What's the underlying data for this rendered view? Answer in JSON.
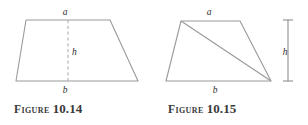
{
  "page": {
    "background_color": "#ffffff",
    "stroke_color": "#9a9a9a",
    "dashed_color": "#b0a9a9",
    "text_color": "#3a3a3a",
    "width": 308,
    "height": 125
  },
  "figures": [
    {
      "id": "figure-10-14",
      "caption_word": "Figure",
      "caption_number": "10.14",
      "shape": "trapezoid",
      "description": "trapezoid with dashed vertical height segment",
      "labels": {
        "top_side": "a",
        "height": "h",
        "bottom_side": "b"
      },
      "geometry": {
        "top_left": [
          26,
          20
        ],
        "top_right": [
          110,
          20
        ],
        "bottom_right": [
          138,
          81
        ],
        "bottom_left": [
          16,
          81
        ],
        "height_line_x": 68,
        "height_line_top_y": 20,
        "height_line_bottom_y": 81
      },
      "label_positions": {
        "a": [
          65,
          15
        ],
        "h": [
          72,
          52
        ],
        "b": [
          65,
          92
        ]
      }
    },
    {
      "id": "figure-10-15",
      "caption_word": "Figure",
      "caption_number": "10.15",
      "shape": "trapezoid",
      "description": "trapezoid split by a diagonal from top-left to bottom-right with external height dimension line",
      "labels": {
        "top_side": "a",
        "height": "h",
        "bottom_side": "b"
      },
      "geometry": {
        "top_left": [
          181,
          21
        ],
        "top_right": [
          240,
          21
        ],
        "bottom_right": [
          271,
          81
        ],
        "bottom_left": [
          166,
          81
        ],
        "diagonal_from": [
          181,
          21
        ],
        "diagonal_to": [
          271,
          81
        ],
        "dimension_line_x": 288,
        "dimension_top_y": 20,
        "dimension_bottom_y": 81,
        "dimension_cap_half_width": 5
      },
      "label_positions": {
        "a": [
          209,
          15
        ],
        "h": [
          283,
          52
        ],
        "b": [
          215,
          92
        ]
      }
    }
  ]
}
